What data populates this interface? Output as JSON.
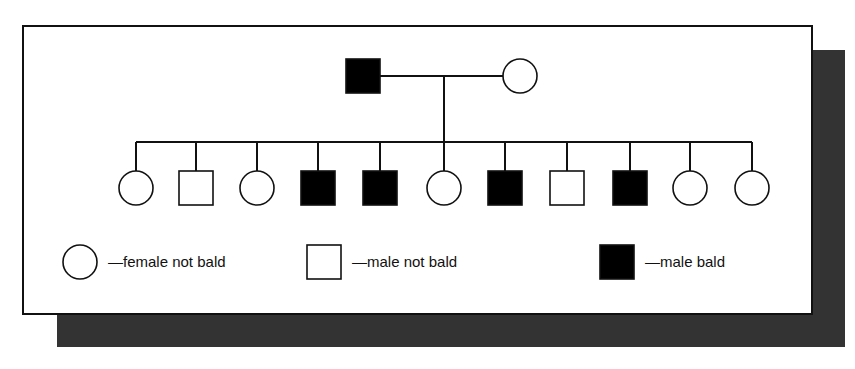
{
  "figure": {
    "type": "pedigree-chart",
    "title": "",
    "panel": {
      "background_color": "#ffffff",
      "border_color": "#111111",
      "shadow_color": "#333333"
    }
  },
  "chart_data": {
    "type": "diagram",
    "diagram_kind": "pedigree",
    "trait": "baldness",
    "symbol_key": {
      "circle_open": "female not bald",
      "square_open": "male not bald",
      "square_filled": "male bald"
    },
    "generations": [
      {
        "id": "I",
        "label": "",
        "individuals": [
          {
            "id": "I-1",
            "sex": "male",
            "shape": "square",
            "filled": true,
            "trait": "bald",
            "cx": 363,
            "cy": 76
          },
          {
            "id": "I-2",
            "sex": "female",
            "shape": "circle",
            "filled": false,
            "trait": "not bald",
            "cx": 520,
            "cy": 76
          }
        ],
        "mating_line": {
          "from": "I-1",
          "to": "I-2",
          "y": 76
        }
      },
      {
        "id": "II",
        "label": "",
        "sibship_line_y": 142,
        "descent_line_x": 444,
        "individuals": [
          {
            "id": "II-1",
            "sex": "female",
            "shape": "circle",
            "filled": false,
            "trait": "not bald",
            "cx": 136,
            "cy": 188
          },
          {
            "id": "II-2",
            "sex": "male",
            "shape": "square",
            "filled": false,
            "trait": "not bald",
            "cx": 196,
            "cy": 188
          },
          {
            "id": "II-3",
            "sex": "female",
            "shape": "circle",
            "filled": false,
            "trait": "not bald",
            "cx": 257,
            "cy": 188
          },
          {
            "id": "II-4",
            "sex": "male",
            "shape": "square",
            "filled": true,
            "trait": "bald",
            "cx": 318,
            "cy": 188
          },
          {
            "id": "II-5",
            "sex": "male",
            "shape": "square",
            "filled": true,
            "trait": "bald",
            "cx": 380,
            "cy": 188
          },
          {
            "id": "II-6",
            "sex": "female",
            "shape": "circle",
            "filled": false,
            "trait": "not bald",
            "cx": 444,
            "cy": 188
          },
          {
            "id": "II-7",
            "sex": "male",
            "shape": "square",
            "filled": true,
            "trait": "bald",
            "cx": 505,
            "cy": 188
          },
          {
            "id": "II-8",
            "sex": "male",
            "shape": "square",
            "filled": false,
            "trait": "not bald",
            "cx": 567,
            "cy": 188
          },
          {
            "id": "II-9",
            "sex": "male",
            "shape": "square",
            "filled": true,
            "trait": "bald",
            "cx": 630,
            "cy": 188
          },
          {
            "id": "II-10",
            "sex": "female",
            "shape": "circle",
            "filled": false,
            "trait": "not bald",
            "cx": 690,
            "cy": 188
          },
          {
            "id": "II-11",
            "sex": "female",
            "shape": "circle",
            "filled": false,
            "trait": "not bald",
            "cx": 752,
            "cy": 188
          }
        ]
      }
    ],
    "counts": {
      "total_offspring": 11,
      "males": 6,
      "females": 5,
      "males_bald": 4,
      "males_not_bald": 2,
      "females_not_bald": 5
    }
  },
  "legend": {
    "items": [
      {
        "key": "circle_open",
        "shape": "circle",
        "filled": false,
        "label": "—female not bald",
        "cx": 80,
        "cy": 262
      },
      {
        "key": "square_open",
        "shape": "square",
        "filled": false,
        "label": "—male not bald",
        "cx": 324,
        "cy": 262
      },
      {
        "key": "square_filled",
        "shape": "square",
        "filled": true,
        "label": "—male bald",
        "cx": 617,
        "cy": 262
      }
    ]
  },
  "colors": {
    "line": "#111111",
    "fill_affected": "#000000",
    "fill_unaffected": "#ffffff",
    "panel_shadow": "#333333"
  }
}
